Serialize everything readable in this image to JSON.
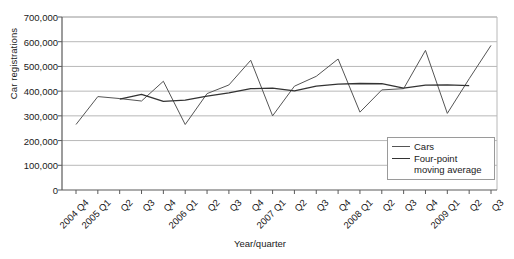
{
  "chart_data": {
    "type": "line",
    "title": "",
    "xlabel": "Year/quarter",
    "ylabel": "Car registrations",
    "ylim": [
      0,
      700000
    ],
    "ytick_values": [
      0,
      100000,
      200000,
      300000,
      400000,
      500000,
      600000,
      700000
    ],
    "ytick_labels": [
      "0",
      "100,000",
      "200,000",
      "300,000",
      "400,000",
      "500,000",
      "600,000",
      "700,000"
    ],
    "grid": true,
    "legend_position": "bottom-right",
    "categories": [
      "2004 Q4",
      "2005 Q1",
      "Q2",
      "Q3",
      "Q4",
      "2006 Q1",
      "Q2",
      "Q3",
      "Q4",
      "2007 Q1",
      "Q2",
      "Q3",
      "Q4",
      "2008 Q1",
      "Q2",
      "Q3",
      "Q4",
      "2009 Q1",
      "Q2",
      "Q3"
    ],
    "series": [
      {
        "name": "Cars",
        "color": "#555555",
        "values": [
          265000,
          378000,
          370000,
          360000,
          440000,
          265000,
          390000,
          425000,
          525000,
          300000,
          420000,
          460000,
          530000,
          315000,
          405000,
          410000,
          565000,
          310000,
          450000,
          585000
        ]
      },
      {
        "name": "Four-point moving average",
        "color": "#333333",
        "values": [
          null,
          null,
          368000,
          387000,
          359000,
          364000,
          380000,
          393000,
          410000,
          412000,
          401000,
          420000,
          428000,
          431000,
          430000,
          412000,
          424000,
          425000,
          422000,
          null
        ]
      }
    ],
    "legend_entries": [
      "Cars",
      "Four-point\nmoving average"
    ]
  },
  "axes": {
    "axis_color": "#5a5a5a",
    "grid_color": "#b8b8b8",
    "plot_bg": "#ffffff"
  }
}
